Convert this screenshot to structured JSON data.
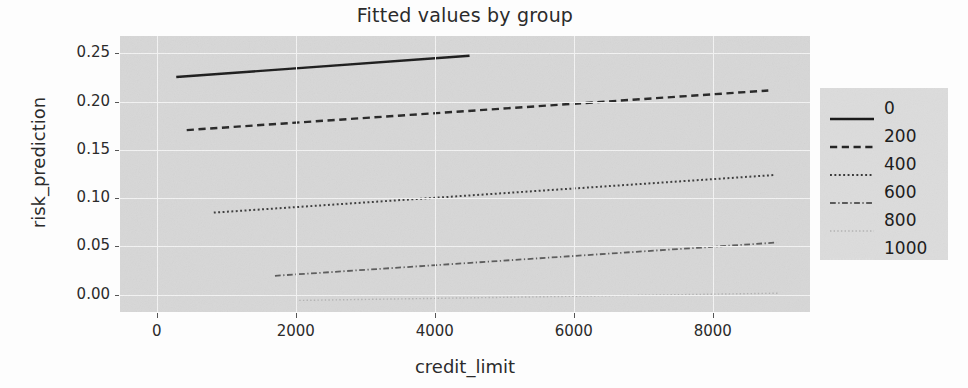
{
  "chart_data": {
    "type": "line",
    "title": "Fitted values by group",
    "xlabel": "credit_limit",
    "ylabel": "risk_prediction",
    "xlim": [
      -530,
      9400
    ],
    "ylim": [
      -0.018,
      0.268
    ],
    "grid": true,
    "legend_position": "right",
    "legend_title": "",
    "xticks": [
      0,
      2000,
      4000,
      6000,
      8000
    ],
    "xtick_labels": [
      "0",
      "2000",
      "4000",
      "6000",
      "8000"
    ],
    "yticks": [
      0.0,
      0.05,
      0.1,
      0.15,
      0.2,
      0.25
    ],
    "ytick_labels": [
      "0.00",
      "0.05",
      "0.10",
      "0.15",
      "0.20",
      "0.25"
    ],
    "series": [
      {
        "name": "0",
        "label": "0",
        "linestyle": "solid",
        "color": "#1a1a1a",
        "width": 2.4,
        "x": [
          280,
          4500
        ],
        "y": [
          0.2255,
          0.2475
        ]
      },
      {
        "name": "200",
        "label": "200",
        "linestyle": "dashed",
        "color": "#252525",
        "width": 2.4,
        "x": [
          430,
          8800
        ],
        "y": [
          0.1705,
          0.2115
        ]
      },
      {
        "name": "400",
        "label": "400",
        "linestyle": "dotted",
        "color": "#3a3a3a",
        "width": 2.0,
        "x": [
          820,
          8900
        ],
        "y": [
          0.085,
          0.124
        ]
      },
      {
        "name": "600",
        "label": "600",
        "linestyle": "dashdot",
        "color": "#5a5a5a",
        "width": 1.8,
        "x": [
          1700,
          8920
        ],
        "y": [
          0.0195,
          0.054
        ]
      },
      {
        "name": "800",
        "label": "800",
        "linestyle": "dotted-fine",
        "color": "#b2b2b2",
        "width": 1.4,
        "x": [
          2050,
          8950
        ],
        "y": [
          -0.006,
          0.0015
        ]
      },
      {
        "name": "1000",
        "label": "1000",
        "linestyle": "dotted-faint",
        "color": "#e2e2e2",
        "width": 1.2,
        "x": [
          null,
          null
        ],
        "y": [
          null,
          null
        ]
      }
    ]
  },
  "figure": {
    "background_color": "#fdfdfd",
    "axes_background_color": "#d7d7d7",
    "gridline_color": "#f4f4f4",
    "text_color": "#2b2b2b",
    "legend_background_color": "#dcdcdc"
  }
}
